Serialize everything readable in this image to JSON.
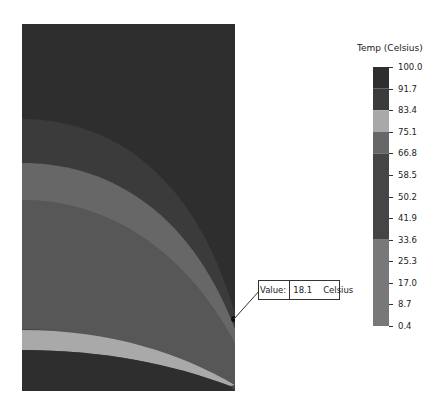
{
  "chart_data": {
    "type": "heatmap",
    "subtype": "contour-plot",
    "title": "",
    "legend": {
      "title": "Temp (Celsius)",
      "position": "right",
      "ticks": [
        "100.0",
        "91.7",
        "83.4",
        "75.1",
        "66.8",
        "58.5",
        "50.2",
        "41.9",
        "33.6",
        "25.3",
        "17.0",
        "8.7",
        "0.4"
      ],
      "bands": [
        {
          "from": 91.7,
          "to": 100.0,
          "color": "#2e2e2e"
        },
        {
          "from": 83.4,
          "to": 91.7,
          "color": "#3b3b3b"
        },
        {
          "from": 75.1,
          "to": 83.4,
          "color": "#a9a9a9"
        },
        {
          "from": 66.8,
          "to": 75.1,
          "color": "#676767"
        },
        {
          "from": 33.6,
          "to": 66.8,
          "color": "#454545"
        },
        {
          "from": 0.4,
          "to": 33.6,
          "color": "#787878"
        }
      ],
      "range": [
        0.4,
        100.0
      ]
    },
    "regions": [
      {
        "name": "top",
        "color": "#2e2e2e"
      },
      {
        "name": "band-2",
        "color": "#3b3b3b"
      },
      {
        "name": "band-3",
        "color": "#676767"
      },
      {
        "name": "band-4",
        "color": "#454545"
      },
      {
        "name": "light-band",
        "color": "#a9a9a9"
      },
      {
        "name": "bottom",
        "color": "#2e2e2e"
      }
    ],
    "probe": {
      "label": "Value:",
      "value": "18.1",
      "unit": "Celsius"
    }
  },
  "legend": {
    "title": "Temp (Celsius)"
  },
  "probe": {
    "label": "Value:",
    "value": "18.1",
    "unit": "Celsius"
  }
}
